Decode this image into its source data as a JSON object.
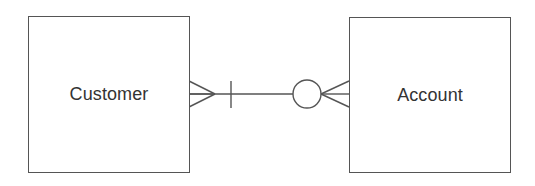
{
  "diagram": {
    "type": "er-diagram",
    "notation": "crows-foot",
    "entities": [
      {
        "id": "customer",
        "label": "Customer"
      },
      {
        "id": "account",
        "label": "Account"
      }
    ],
    "relationship": {
      "from": "customer",
      "to": "account",
      "customer_end": "many (crow's foot) with one/mandatory bar",
      "account_end": "zero or many (circle + crow's foot)"
    },
    "colors": {
      "stroke": "#555555",
      "text": "#333333",
      "background": "#ffffff"
    }
  }
}
